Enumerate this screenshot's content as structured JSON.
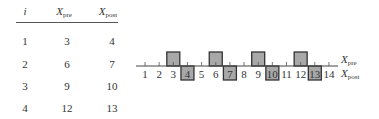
{
  "table": {
    "headers": {
      "i": "i",
      "pre_main": "X",
      "pre_sub": "pre",
      "post_main": "X",
      "post_sub": "post"
    },
    "rows": [
      {
        "i": "1",
        "pre": "3",
        "post": "4"
      },
      {
        "i": "2",
        "pre": "6",
        "post": "7"
      },
      {
        "i": "3",
        "pre": "9",
        "post": "10"
      },
      {
        "i": "4",
        "pre": "12",
        "post": "13"
      }
    ]
  },
  "diagram": {
    "ticks": [
      "1",
      "2",
      "3",
      "4",
      "5",
      "6",
      "7",
      "8",
      "9",
      "10",
      "11",
      "12",
      "13",
      "14"
    ],
    "pre_positions": [
      3,
      6,
      9,
      12
    ],
    "post_positions": [
      4,
      7,
      10,
      13
    ],
    "label_pre_main": "X",
    "label_pre_sub": "pre",
    "label_post_main": "X",
    "label_post_sub": "post",
    "box_fill": "#a8a8a8",
    "box_stroke": "#333333"
  }
}
